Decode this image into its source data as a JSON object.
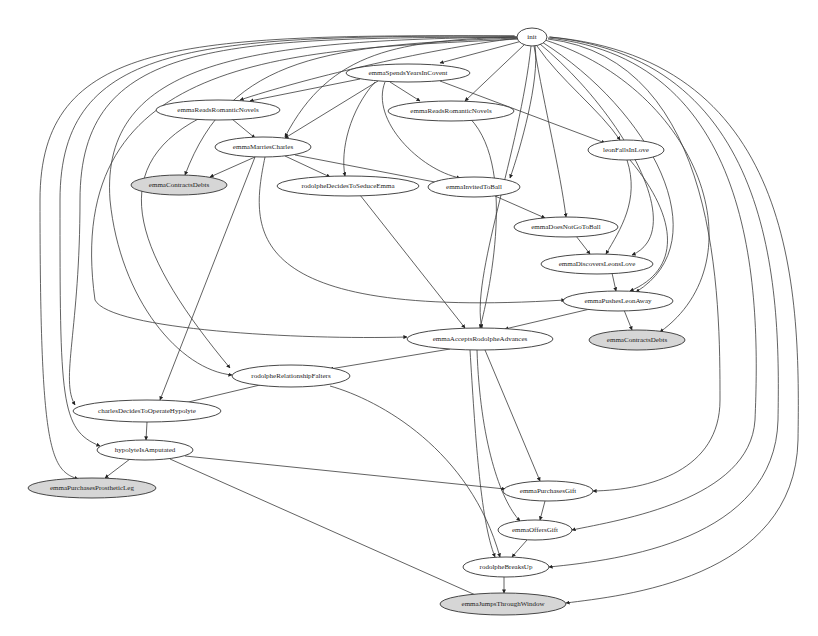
{
  "graph": {
    "nodes": [
      {
        "id": "init",
        "label": "init",
        "x": 532,
        "y": 37,
        "rx": 15,
        "ry": 9,
        "terminal": false
      },
      {
        "id": "emmaSpendsYearsInCovent",
        "label": "emmaSpendsYearsInCovent",
        "x": 408,
        "y": 73,
        "rx": 62,
        "ry": 9,
        "terminal": false
      },
      {
        "id": "emmaReadsRomanticNovels1",
        "label": "emmaReadsRomanticNovels",
        "x": 218,
        "y": 110,
        "rx": 62,
        "ry": 10,
        "terminal": false
      },
      {
        "id": "emmaReadsRomanticNovels2",
        "label": "emmaReadsRomanticNovels",
        "x": 451,
        "y": 111,
        "rx": 63,
        "ry": 10,
        "terminal": false
      },
      {
        "id": "emmaMarriesCharles",
        "label": "emmaMarriesCharles",
        "x": 263,
        "y": 147,
        "rx": 48,
        "ry": 10,
        "terminal": false
      },
      {
        "id": "leonFallsInLove",
        "label": "leonFallsInLove",
        "x": 626,
        "y": 150,
        "rx": 38,
        "ry": 10,
        "terminal": false
      },
      {
        "id": "emmaContractsDebts1",
        "label": "emmaContractsDebts",
        "x": 179,
        "y": 185,
        "rx": 48,
        "ry": 10,
        "terminal": true
      },
      {
        "id": "rodolpheDecidesToSeduceEmma",
        "label": "rodolpheDecidesToSeduceEmma",
        "x": 348,
        "y": 186,
        "rx": 71,
        "ry": 10,
        "terminal": false
      },
      {
        "id": "emmaInvitedToBall",
        "label": "emmaInvitedToBall",
        "x": 474,
        "y": 187,
        "rx": 46,
        "ry": 10,
        "terminal": false
      },
      {
        "id": "emmaDoesNotGoToBall",
        "label": "emmaDoesNotGoToBall",
        "x": 566,
        "y": 227,
        "rx": 52,
        "ry": 10,
        "terminal": false
      },
      {
        "id": "emmaDiscoversLeonsLove",
        "label": "emmaDiscoversLeonsLove",
        "x": 597,
        "y": 264,
        "rx": 56,
        "ry": 10,
        "terminal": false
      },
      {
        "id": "emmaPushesLeonAway",
        "label": "emmaPushesLeonAway",
        "x": 618,
        "y": 301,
        "rx": 55,
        "ry": 10,
        "terminal": false
      },
      {
        "id": "emmaContractsDebts2",
        "label": "emmaContractsDebts",
        "x": 637,
        "y": 340,
        "rx": 48,
        "ry": 10,
        "terminal": true
      },
      {
        "id": "emmaAcceptsRodolpheAdvances",
        "label": "emmaAcceptsRodolpheAdvances",
        "x": 480,
        "y": 339,
        "rx": 73,
        "ry": 11,
        "terminal": false
      },
      {
        "id": "rodolpheRelationshipFalters",
        "label": "rodolpheRelationshipFalters",
        "x": 291,
        "y": 376,
        "rx": 59,
        "ry": 11,
        "terminal": false
      },
      {
        "id": "charlesDecidesToOperateHypolyte",
        "label": "charlesDecidesToOperateHypolyte",
        "x": 147,
        "y": 411,
        "rx": 74,
        "ry": 11,
        "terminal": false
      },
      {
        "id": "hypolyteIsAmputated",
        "label": "hypolyteIsAmputated",
        "x": 145,
        "y": 450,
        "rx": 48,
        "ry": 10,
        "terminal": false
      },
      {
        "id": "emmaPurchasesProstheticLeg",
        "label": "emmaPurchasesProstheticLeg",
        "x": 92,
        "y": 488,
        "rx": 64,
        "ry": 10,
        "terminal": true
      },
      {
        "id": "emmaPurchasesGift",
        "label": "emmaPurchasesGift",
        "x": 548,
        "y": 491,
        "rx": 45,
        "ry": 10,
        "terminal": false
      },
      {
        "id": "emmaOffersGift",
        "label": "emmaOffersGift",
        "x": 535,
        "y": 530,
        "rx": 37,
        "ry": 10,
        "terminal": false
      },
      {
        "id": "rodolpheBreaksUp",
        "label": "rodolpheBreaksUp",
        "x": 506,
        "y": 567,
        "rx": 43,
        "ry": 10,
        "terminal": false
      },
      {
        "id": "emmaJumpsThroughWindow",
        "label": "emmaJumpsThroughWindow",
        "x": 503,
        "y": 604,
        "rx": 63,
        "ry": 11,
        "terminal": true
      }
    ],
    "edges": [
      {
        "d": "M522,41 L440,63"
      },
      {
        "d": "M524,45 L465,101"
      },
      {
        "d": "M518,38 C420,50 300,80 240,100"
      },
      {
        "d": "M518,38 C330,45 230,55 185,175"
      },
      {
        "d": "M519,37 C400,40 330,50 285,137"
      },
      {
        "d": "M535,46 C540,80 520,150 510,178"
      },
      {
        "d": "M537,46 C560,80 600,110 620,140"
      },
      {
        "d": "M534,46 C545,110 560,170 566,217"
      },
      {
        "d": "M540,44 C620,110 690,230 632,255"
      },
      {
        "d": "M542,42 C650,110 720,240 636,292"
      },
      {
        "d": "M545,40 C700,90 760,260 660,332"
      },
      {
        "d": "M520,39 C300,50 60,50 95,300 C110,330 300,340 407,337"
      },
      {
        "d": "M518,37 C250,40 100,60 110,200 C120,300 180,370 232,375"
      },
      {
        "d": "M516,37 C220,38 80,40 80,200 C80,330 60,380 75,405"
      },
      {
        "d": "M515,36 C200,36 60,40 60,200 C60,400 60,430 100,446"
      },
      {
        "d": "M514,36 C180,34 40,40 40,200 C40,450 50,470 78,479"
      },
      {
        "d": "M548,39 C720,60 720,300 720,400 C720,470 650,490 593,491"
      },
      {
        "d": "M548,38 C760,60 760,300 755,420 C750,500 620,520 572,530"
      },
      {
        "d": "M549,37 C780,60 780,300 778,420 C775,540 620,560 549,567"
      },
      {
        "d": "M550,37 C800,60 800,300 798,440 C795,580 620,596 566,603"
      },
      {
        "d": "M531,46 C520,150 470,280 482,328"
      },
      {
        "d": "M360,79 L250,101"
      },
      {
        "d": "M390,82 L420,101"
      },
      {
        "d": "M378,81 L285,138"
      },
      {
        "d": "M375,82 C350,110 340,150 345,176"
      },
      {
        "d": "M385,82 C370,120 420,170 460,178"
      },
      {
        "d": "M440,81 L605,143"
      },
      {
        "d": "M232,119 L255,138"
      },
      {
        "d": "M200,118 C100,170 140,260 230,368"
      },
      {
        "d": "M255,157 L210,177"
      },
      {
        "d": "M295,155 L440,183"
      },
      {
        "d": "M285,156 L330,177"
      },
      {
        "d": "M265,157 C250,230 240,320 565,300"
      },
      {
        "d": "M255,157 L160,400"
      },
      {
        "d": "M460,110 C520,150 490,290 480,328"
      },
      {
        "d": "M495,196 L545,218"
      },
      {
        "d": "M576,236 L590,254"
      },
      {
        "d": "M627,160 C640,200 620,230 606,254"
      },
      {
        "d": "M630,160 C680,220 680,270 630,291"
      },
      {
        "d": "M612,273 L616,291"
      },
      {
        "d": "M624,310 L632,330"
      },
      {
        "d": "M590,309 L505,329"
      },
      {
        "d": "M360,195 L465,328"
      },
      {
        "d": "M450,349 L330,369"
      },
      {
        "d": "M470,350 C475,430 480,520 495,557"
      },
      {
        "d": "M485,350 L540,481"
      },
      {
        "d": "M477,350 C480,440 500,500 520,521"
      },
      {
        "d": "M260,385 L180,404"
      },
      {
        "d": "M330,386 C380,400 470,450 500,557"
      },
      {
        "d": "M147,422 L146,440"
      },
      {
        "d": "M130,459 L105,478"
      },
      {
        "d": "M185,456 L505,489"
      },
      {
        "d": "M170,459 L480,597"
      },
      {
        "d": "M545,501 L540,520"
      },
      {
        "d": "M527,540 L512,557"
      },
      {
        "d": "M504,577 L504,593"
      }
    ]
  }
}
